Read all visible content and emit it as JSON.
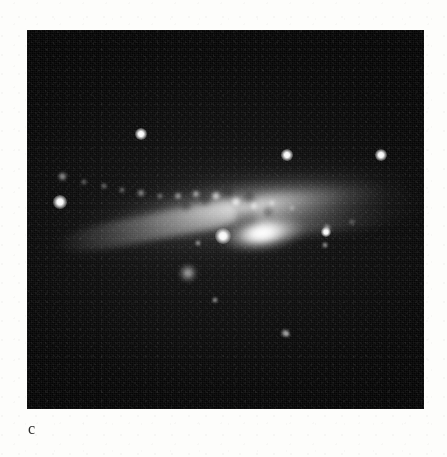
{
  "figure": {
    "panel_label": "c",
    "caption_text": "",
    "kind": "astronomical-plate",
    "plate": {
      "x": 27,
      "y": 30,
      "width": 397,
      "height": 379,
      "background_color": "#050505",
      "sky_color": "#0b0b0b",
      "page_color": "#fdfdfb",
      "label_color": "#2b2b2b"
    },
    "galaxy": {
      "name": "",
      "center_x": 238,
      "center_y": 203,
      "position_angle_deg": -8,
      "major_axis_px": 380,
      "minor_axis_px": 120,
      "core_brightness": "saturated-white",
      "knots": [
        {
          "x": 62,
          "y": 176,
          "r": 4.5,
          "brightness": 0.72
        },
        {
          "x": 84,
          "y": 182,
          "r": 3.0,
          "brightness": 0.55
        },
        {
          "x": 104,
          "y": 186,
          "r": 3.4,
          "brightness": 0.62
        },
        {
          "x": 122,
          "y": 190,
          "r": 3.0,
          "brightness": 0.58
        },
        {
          "x": 141,
          "y": 193,
          "r": 3.6,
          "brightness": 0.66
        },
        {
          "x": 160,
          "y": 196,
          "r": 3.2,
          "brightness": 0.6
        },
        {
          "x": 178,
          "y": 196,
          "r": 4.0,
          "brightness": 0.7
        },
        {
          "x": 196,
          "y": 194,
          "r": 4.4,
          "brightness": 0.78
        },
        {
          "x": 216,
          "y": 196,
          "r": 5.2,
          "brightness": 0.9
        },
        {
          "x": 236,
          "y": 202,
          "r": 6.0,
          "brightness": 0.98
        },
        {
          "x": 254,
          "y": 206,
          "r": 4.6,
          "brightness": 0.84
        },
        {
          "x": 272,
          "y": 203,
          "r": 3.8,
          "brightness": 0.7
        },
        {
          "x": 292,
          "y": 208,
          "r": 3.2,
          "brightness": 0.58
        },
        {
          "x": 327,
          "y": 228,
          "r": 4.2,
          "brightness": 0.72
        },
        {
          "x": 352,
          "y": 222,
          "r": 2.6,
          "brightness": 0.45
        }
      ],
      "dust_patches": [
        {
          "x": 205,
          "y": 200,
          "r": 6
        },
        {
          "x": 228,
          "y": 192,
          "r": 5
        },
        {
          "x": 249,
          "y": 197,
          "r": 6
        },
        {
          "x": 268,
          "y": 212,
          "r": 5
        },
        {
          "x": 186,
          "y": 206,
          "r": 5
        }
      ]
    },
    "stars": [
      {
        "id": "star-upper-left",
        "x": 141,
        "y": 134,
        "r": 3.2,
        "faint": false
      },
      {
        "id": "star-upper-mid",
        "x": 287,
        "y": 155,
        "r": 3.0,
        "faint": false
      },
      {
        "id": "star-upper-right",
        "x": 381,
        "y": 155,
        "r": 3.2,
        "faint": false
      },
      {
        "id": "star-disk-left",
        "x": 60,
        "y": 202,
        "r": 3.6,
        "faint": false
      },
      {
        "id": "star-below-core",
        "x": 223,
        "y": 236,
        "r": 4.2,
        "faint": false
      },
      {
        "id": "star-right-disk",
        "x": 326,
        "y": 232,
        "r": 2.8,
        "faint": false
      },
      {
        "id": "star-faint-left",
        "x": 198,
        "y": 243,
        "r": 1.8,
        "faint": true
      },
      {
        "id": "star-faint-right",
        "x": 325,
        "y": 245,
        "r": 1.8,
        "faint": true
      },
      {
        "id": "star-lower-mid",
        "x": 215,
        "y": 300,
        "r": 1.8,
        "faint": true
      },
      {
        "id": "star-lower-faint",
        "x": 285,
        "y": 333,
        "r": 2.2,
        "faint": true
      },
      {
        "id": "star-bottom-right",
        "x": 287,
        "y": 334,
        "r": 1.6,
        "faint": true
      }
    ],
    "companion": {
      "id": "fuzzy-companion",
      "x": 188,
      "y": 273,
      "r": 9
    }
  }
}
